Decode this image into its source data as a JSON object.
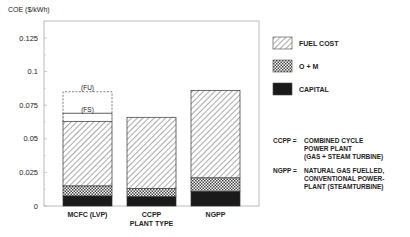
{
  "chart_data": {
    "type": "bar",
    "stacked": true,
    "title": "",
    "ylabel": "COE ($/kWh)",
    "xlabel": "PLANT TYPE",
    "ylim": [
      0,
      0.14
    ],
    "yticks": [
      "0",
      "0.025",
      "0.05",
      "0.075",
      "0.1",
      "0.125"
    ],
    "ytick_values": [
      0,
      0.025,
      0.05,
      0.075,
      0.1,
      0.125
    ],
    "categories": [
      "MCFC (LVP)",
      "CCPP",
      "NGPP"
    ],
    "series": [
      {
        "name": "CAPITAL",
        "pattern": "solid",
        "values": [
          0.0075,
          0.007,
          0.011
        ]
      },
      {
        "name": "O + M",
        "pattern": "checker",
        "values": [
          0.0075,
          0.006,
          0.01
        ]
      },
      {
        "name": "FUEL COST",
        "pattern": "hatch",
        "values": [
          0.048,
          0.053,
          0.065
        ]
      }
    ],
    "totals": [
      0.063,
      0.066,
      0.086
    ],
    "annotations": [
      {
        "label": "(FS)",
        "category": "MCFC (LVP)",
        "value": 0.069,
        "style": "solid-line"
      },
      {
        "label": "(FU)",
        "category": "MCFC (LVP)",
        "value": 0.085,
        "style": "dashed-box"
      }
    ],
    "legend": {
      "position": "right",
      "entries": [
        {
          "label": "FUEL COST",
          "pattern": "hatch"
        },
        {
          "label": "O + M",
          "pattern": "checker"
        },
        {
          "label": "CAPITAL",
          "pattern": "solid"
        }
      ]
    },
    "notes": [
      {
        "abbr": "CCPP =",
        "lines": [
          "COMBINED CYCLE",
          "POWER PLANT",
          "(GAS + STEAM TURBINE)"
        ]
      },
      {
        "abbr": "NGPP =",
        "lines": [
          "NATURAL GAS FUELLED,",
          "CONVENTIONAL POWER-",
          "PLANT (STEAMTURBINE)"
        ]
      }
    ],
    "grid": false
  }
}
